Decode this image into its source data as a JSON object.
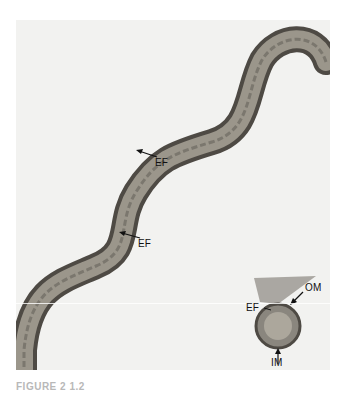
{
  "figure": {
    "type": "electron micrograph",
    "labels": {
      "ef_upper": "EF",
      "ef_lower": "EF",
      "inset_ef": "EF",
      "inset_om": "OM",
      "inset_im": "IM"
    },
    "caption": "FIGURE 2 1.2"
  }
}
